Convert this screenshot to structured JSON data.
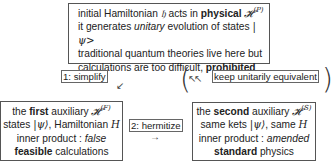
{
  "top_box": {
    "line1": {
      "pre": "initial Hamiltonian ",
      "symbol": "𝔥",
      "mid": " acts in ",
      "bold": "physical",
      "space": " ",
      "space_symbol": "𝓗",
      "sup": "(P)"
    },
    "line2": {
      "pre": "it generates ",
      "italic": "unitary",
      "post": " evolution of states ",
      "ket": "|ψ>"
    },
    "line3": "traditional quantum theories live here but",
    "line4": {
      "pre": "calculations are too difficult, ",
      "bold": "prohibited"
    }
  },
  "steps": {
    "simplify": "1: simplify",
    "keep": "keep unitarily equivalent",
    "hermitize": "2: hermitize"
  },
  "arrows": {
    "simplify_arrow": "↙",
    "keep_arrow": "↖↖",
    "hermitize_arrow": "→",
    "paren_open": "(",
    "paren_close": ")"
  },
  "left_box": {
    "line1": {
      "pre": "the ",
      "bold": "first",
      "post": " auxiliary ",
      "space_symbol": "𝓗",
      "sup": "(F)"
    },
    "line2": {
      "pre": "states ",
      "ket": "|ψ⟩",
      "mid": ", Hamiltonian ",
      "symbol": "H"
    },
    "line3": {
      "pre": "inner product : ",
      "italic": "false"
    },
    "line4": {
      "bold": "feasible",
      "post": " calculations"
    }
  },
  "right_box": {
    "line1": {
      "pre": "the ",
      "bold": "second",
      "post": " auxiliary ",
      "space_symbol": "𝓗",
      "sup": "(S)"
    },
    "line2": {
      "pre": "same kets ",
      "ket": "|ψ⟩",
      "mid": ", same ",
      "symbol": "H"
    },
    "line3": {
      "pre": "inner product : ",
      "italic": "amended"
    },
    "line4": {
      "bold": "standard",
      "post": " physics"
    }
  }
}
